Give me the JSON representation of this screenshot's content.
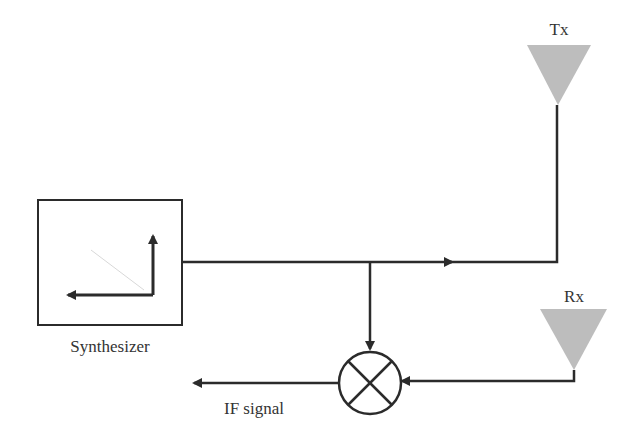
{
  "diagram": {
    "type": "FMCW radar block diagram",
    "colors": {
      "line": "#2b2b2b",
      "antenna_fill": "#bdbdbd",
      "background": "#ffffff"
    },
    "blocks": {
      "synthesizer": {
        "label": "Synthesizer"
      },
      "tx_antenna": {
        "label": "Tx"
      },
      "rx_antenna": {
        "label": "Rx"
      },
      "mixer": {
        "label": ""
      },
      "if_output": {
        "label": "IF signal"
      }
    }
  }
}
